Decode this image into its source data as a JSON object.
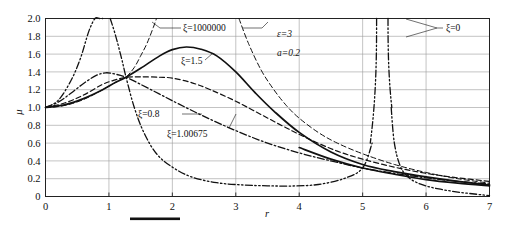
{
  "figure": {
    "background": "#ffffff",
    "ink": "#111111",
    "grid_color": "#9a9a9a"
  },
  "axes": {
    "x_label": "r",
    "y_label": "μ",
    "x_ticks": [
      "0",
      "1",
      "2",
      "3",
      "4",
      "5",
      "6",
      "7"
    ],
    "y_ticks": [
      "0",
      "0.2",
      "0.4",
      "0.6",
      "0.8",
      "1.0",
      "1.2",
      "1.4",
      "1.6",
      "1.8",
      "2.0"
    ]
  },
  "parameters": {
    "epsilon_label": "ε=3",
    "a_label": "a=0.2"
  },
  "curve_labels": {
    "xi_huge": "ξ=1000000",
    "xi_1p5": "ξ=1.5",
    "xi_0p8": "ξ=0.8",
    "xi_1p00675": "ξ=1.00675",
    "xi_0": "ξ=0"
  },
  "chart_data": {
    "type": "line",
    "title": "",
    "xlabel": "r",
    "ylabel": "μ",
    "xlim": [
      0,
      7
    ],
    "ylim": [
      0,
      2.0
    ],
    "xticks": [
      0,
      1,
      2,
      3,
      4,
      5,
      6,
      7
    ],
    "yticks": [
      0,
      0.2,
      0.4,
      0.6,
      0.8,
      1.0,
      1.2,
      1.4,
      1.6,
      1.8,
      2.0
    ],
    "grid": true,
    "legend": "inline-annotations",
    "annotations": [
      {
        "text": "ε=3",
        "x": 4.15,
        "y": 1.84
      },
      {
        "text": "a=0.2",
        "x": 4.15,
        "y": 1.66
      },
      {
        "text": "ξ=1000000",
        "x": 2.45,
        "y": 1.92
      },
      {
        "text": "ξ=1.5",
        "x": 2.68,
        "y": 1.25
      },
      {
        "text": "ξ=0.8",
        "x": 1.72,
        "y": 0.84
      },
      {
        "text": "ξ=1.00675",
        "x": 2.85,
        "y": 0.6
      },
      {
        "text": "ξ=0",
        "x": 6.25,
        "y": 1.88
      }
    ],
    "common_intersection": {
      "r": 1.27,
      "mu": 1.34
    },
    "series": [
      {
        "name": "ξ=1000000",
        "style": "dashed",
        "description": "Large damping branch: rises steeply to asymptote near r=1.75, re-enters from top near r=3.05 and decays",
        "x": [
          0,
          0.2,
          0.4,
          0.6,
          0.8,
          1.0,
          1.2,
          1.27,
          1.4,
          1.5,
          1.6,
          1.7,
          1.75
        ],
        "y": [
          1.0,
          1.01,
          1.04,
          1.09,
          1.16,
          1.24,
          1.32,
          1.34,
          1.45,
          1.58,
          1.72,
          1.9,
          2.0
        ],
        "x2": [
          3.05,
          3.2,
          3.4,
          3.6,
          3.8,
          4.0,
          4.3,
          4.6,
          5.0,
          5.5,
          6.0,
          6.5,
          7.0
        ],
        "y2": [
          2.0,
          1.72,
          1.42,
          1.2,
          1.02,
          0.88,
          0.72,
          0.6,
          0.48,
          0.36,
          0.27,
          0.2,
          0.15
        ]
      },
      {
        "name": "ξ=1.5",
        "style": "solid",
        "description": "Moderate damping: monotone rise to peak 1.68 at r=2.22, then decay",
        "x": [
          0,
          0.3,
          0.6,
          0.9,
          1.1,
          1.27,
          1.5,
          1.8,
          2.0,
          2.22,
          2.45,
          2.7,
          3.0,
          3.3,
          3.6,
          4.0,
          4.5,
          5.0,
          5.5,
          6.0,
          6.5,
          7.0
        ],
        "y": [
          1.0,
          1.03,
          1.1,
          1.2,
          1.28,
          1.34,
          1.44,
          1.58,
          1.65,
          1.68,
          1.655,
          1.58,
          1.4,
          1.17,
          0.96,
          0.72,
          0.5,
          0.36,
          0.28,
          0.22,
          0.17,
          0.13
        ]
      },
      {
        "name": "ξ=1.00675",
        "style": "dashed",
        "description": "Critical-like branch: broad flat maximum ~1.345 near r=2.0, slow decay",
        "x": [
          0,
          0.3,
          0.6,
          0.9,
          1.1,
          1.27,
          1.5,
          1.8,
          2.0,
          2.3,
          2.6,
          3.0,
          3.4,
          3.8,
          4.2,
          4.6,
          5.0,
          5.5,
          6.0,
          6.5,
          7.0
        ],
        "y": [
          1.0,
          1.05,
          1.14,
          1.26,
          1.31,
          1.34,
          1.345,
          1.34,
          1.33,
          1.28,
          1.2,
          1.07,
          0.92,
          0.77,
          0.63,
          0.51,
          0.42,
          0.33,
          0.26,
          0.21,
          0.17
        ]
      },
      {
        "name": "ξ=0.8",
        "style": "dash-dot",
        "description": "Light damping: early peak 1.39 near r=0.95, dips through intersection then decays",
        "x": [
          0,
          0.2,
          0.4,
          0.6,
          0.8,
          0.95,
          1.1,
          1.27,
          1.5,
          1.8,
          2.1,
          2.5,
          3.0,
          3.5,
          4.0,
          4.5,
          5.0,
          5.5,
          6.0,
          6.5,
          7.0
        ],
        "y": [
          1.0,
          1.06,
          1.16,
          1.27,
          1.36,
          1.39,
          1.375,
          1.34,
          1.26,
          1.15,
          1.04,
          0.9,
          0.74,
          0.6,
          0.49,
          0.4,
          0.32,
          0.26,
          0.21,
          0.17,
          0.14
        ]
      },
      {
        "name": "ξ=0",
        "style": "dash-dot-dot",
        "description": "Undamped: two resonance asymptotes at r≈0.95 and r≈5.25, plus a second branch asymptote at r≈5.38; minimum ~0.12 near r=3.9",
        "branch1_x": [
          0,
          0.2,
          0.4,
          0.55,
          0.68,
          0.78,
          0.85,
          0.9
        ],
        "branch1_y": [
          1.0,
          1.08,
          1.3,
          1.55,
          1.85,
          2.0,
          2.0,
          2.0
        ],
        "branch2_x": [
          1.02,
          1.1,
          1.2,
          1.27,
          1.4,
          1.55,
          1.75,
          2.0,
          2.3,
          2.7,
          3.1,
          3.5,
          3.9,
          4.3,
          4.7,
          5.0,
          5.15
        ],
        "branch2_y": [
          2.0,
          1.82,
          1.55,
          1.34,
          1.0,
          0.72,
          0.48,
          0.33,
          0.22,
          0.155,
          0.13,
          0.12,
          0.118,
          0.135,
          0.2,
          0.32,
          0.6
        ],
        "branch3_x": [
          5.45,
          5.5,
          5.6,
          5.75,
          5.95,
          6.2,
          6.5,
          6.8,
          7.0
        ],
        "branch3_y": [
          1.0,
          0.6,
          0.33,
          0.2,
          0.13,
          0.085,
          0.05,
          0.025,
          0.01
        ],
        "asymptotes": [
          0.95,
          5.25,
          5.38
        ]
      },
      {
        "name": "upper envelope tail",
        "style": "solid",
        "description": "Heavy solid tail running from the intersection through (5.0,0.32) to (7,0.12)",
        "x": [
          4.0,
          4.5,
          5.0,
          5.5,
          6.0,
          6.5,
          7.0
        ],
        "y": [
          0.55,
          0.42,
          0.32,
          0.25,
          0.19,
          0.15,
          0.12
        ]
      }
    ]
  }
}
